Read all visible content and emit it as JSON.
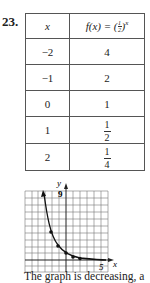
{
  "problem_number": "23.",
  "table": {
    "header_x": "x",
    "header_fx": "f(x) = (½)ˣ",
    "header_fx_prefix": "f(x) = (",
    "header_fx_frac_num": "1",
    "header_fx_frac_den": "2",
    "header_fx_suffix": ")",
    "header_fx_exp": "x",
    "rows": [
      {
        "x": "−2",
        "fx": "4"
      },
      {
        "x": "−1",
        "fx": "2"
      },
      {
        "x": "0",
        "fx": "1"
      },
      {
        "x": "1",
        "fx_num": "1",
        "fx_den": "2"
      },
      {
        "x": "2",
        "fx_num": "1",
        "fx_den": "4"
      }
    ]
  },
  "graph": {
    "y_axis_label": "y",
    "x_axis_label": "x",
    "y_tick_label": "9",
    "x_tick_label": "5",
    "points": [
      [
        -2,
        4
      ],
      [
        -1,
        2
      ],
      [
        0,
        1
      ],
      [
        1,
        0.5
      ],
      [
        2,
        0.25
      ]
    ]
  },
  "caption": "The graph is decreasing, a"
}
